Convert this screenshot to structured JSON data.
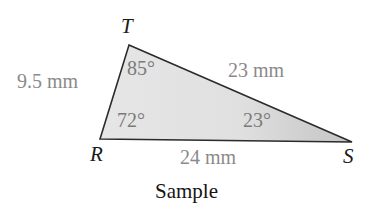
{
  "figure": {
    "caption": "Sample",
    "shape": "triangle",
    "fill_color": "#e2e2e2",
    "fill_color_dark": "#c6c6c6",
    "stroke_color": "#2b2b2b",
    "label_color": "#8a8a8a",
    "vertex_label_color": "#1a1a1a",
    "background_color": "#ffffff"
  },
  "vertices": {
    "T": {
      "label": "T",
      "x": 129,
      "y": 45
    },
    "R": {
      "label": "R",
      "x": 100,
      "y": 139
    },
    "S": {
      "label": "S",
      "x": 352,
      "y": 142
    }
  },
  "sides": {
    "RT": {
      "label": "9.5 mm",
      "value": 9.5,
      "unit": "mm"
    },
    "TS": {
      "label": "23 mm",
      "value": 23,
      "unit": "mm"
    },
    "RS": {
      "label": "24 mm",
      "value": 24,
      "unit": "mm"
    }
  },
  "angles": {
    "T": {
      "label": "85°",
      "value": 85,
      "unit": "degrees"
    },
    "R": {
      "label": "72°",
      "value": 72,
      "unit": "degrees"
    },
    "S": {
      "label": "23°",
      "value": 23,
      "unit": "degrees"
    }
  }
}
